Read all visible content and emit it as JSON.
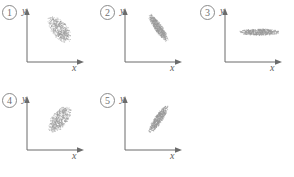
{
  "figure": {
    "background_color": "#ffffff",
    "axis_color": "#6b6b6b",
    "point_color": "#9a9a9a",
    "panel_count": 5
  },
  "panels": [
    {
      "index_label": "1",
      "y_axis_label": "y",
      "x_axis_label": "x",
      "position": {
        "left": 0,
        "top": 0
      }
    },
    {
      "index_label": "2",
      "y_axis_label": "y",
      "x_axis_label": "x",
      "position": {
        "left": 98,
        "top": 0
      }
    },
    {
      "index_label": "3",
      "y_axis_label": "y",
      "x_axis_label": "x",
      "position": {
        "left": 198,
        "top": 0
      }
    },
    {
      "index_label": "4",
      "y_axis_label": "y",
      "x_axis_label": "x",
      "position": {
        "left": 0,
        "top": 88
      }
    },
    {
      "index_label": "5",
      "y_axis_label": "y",
      "x_axis_label": "x",
      "position": {
        "left": 98,
        "top": 88
      }
    }
  ],
  "chart_data": [
    {
      "type": "scatter",
      "title": "1",
      "xlabel": "x",
      "ylabel": "y",
      "grid": false,
      "legend": null,
      "n_points": 520,
      "cloud": {
        "shape": "ellipse",
        "center_x": 0.56,
        "center_y": 0.62,
        "semi_major": 0.3,
        "semi_minor": 0.145,
        "rotation_deg": -55,
        "correlation": -0.7,
        "description": "moderately negative tilt, broad ellipse"
      }
    },
    {
      "type": "scatter",
      "title": "2",
      "xlabel": "x",
      "ylabel": "y",
      "grid": false,
      "legend": null,
      "n_points": 620,
      "cloud": {
        "shape": "ellipse",
        "center_x": 0.58,
        "center_y": 0.64,
        "semi_major": 0.31,
        "semi_minor": 0.075,
        "rotation_deg": -58,
        "correlation": -0.93,
        "description": "narrow steep negative slope, dense"
      }
    },
    {
      "type": "scatter",
      "title": "3",
      "xlabel": "x",
      "ylabel": "y",
      "grid": false,
      "legend": null,
      "n_points": 600,
      "cloud": {
        "shape": "ellipse",
        "center_x": 0.6,
        "center_y": 0.56,
        "semi_major": 0.37,
        "semi_minor": 0.065,
        "rotation_deg": 0,
        "correlation": 0.0,
        "description": "flat horizontal ellipse, no correlation"
      }
    },
    {
      "type": "scatter",
      "title": "4",
      "xlabel": "x",
      "ylabel": "y",
      "grid": false,
      "legend": null,
      "n_points": 520,
      "cloud": {
        "shape": "ellipse",
        "center_x": 0.57,
        "center_y": 0.58,
        "semi_major": 0.3,
        "semi_minor": 0.145,
        "rotation_deg": 55,
        "correlation": 0.7,
        "description": "moderately positive tilt, broad ellipse"
      }
    },
    {
      "type": "scatter",
      "title": "5",
      "xlabel": "x",
      "ylabel": "y",
      "grid": false,
      "legend": null,
      "n_points": 620,
      "cloud": {
        "shape": "ellipse",
        "center_x": 0.58,
        "center_y": 0.58,
        "semi_major": 0.31,
        "semi_minor": 0.075,
        "rotation_deg": 58,
        "correlation": 0.93,
        "description": "narrow steep positive slope, dense"
      }
    }
  ]
}
